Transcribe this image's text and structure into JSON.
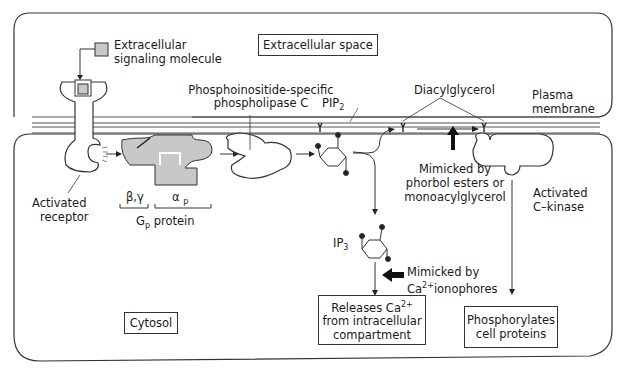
{
  "diagram": {
    "regions": {
      "extracellular": "Extracellular space",
      "cytosol": "Cytosol",
      "membrane_line1": "Plasma",
      "membrane_line2": "membrane"
    },
    "labels": {
      "signal_line1": "Extracellular",
      "signal_line2": "signaling molecule",
      "plc_line1": "Phosphoinositide-specific",
      "plc_line2": "phospholipase C",
      "pip2": "PIP",
      "pip2_sub": "2",
      "dag": "Diacylglycerol",
      "receptor_line1": "Activated",
      "receptor_line2": "receptor",
      "beta_gamma": "β,γ",
      "alpha": "α",
      "alpha_sub": "p",
      "gp_main": "G",
      "gp_sub": "p",
      "gp_rest": " protein",
      "phorbol_line1": "Mimicked by",
      "phorbol_line2": "phorbol esters or",
      "phorbol_line3": "monoacylglycerol",
      "ckinase_line1": "Activated",
      "ckinase_line2": "C–kinase",
      "ip3": "IP",
      "ip3_sub": "3",
      "iono_line1": "Mimicked by",
      "iono_ca": "Ca",
      "iono_sup": "2+",
      "iono_rest": "ionophores"
    },
    "outcomes": {
      "calcium_line1": "Releases Ca",
      "calcium_sup": "2+",
      "calcium_line2": "from intracellular",
      "calcium_line3": "compartment",
      "phos_line1": "Phosphorylates",
      "phos_line2": "cell proteins"
    },
    "colors": {
      "stroke": "#222222",
      "protein_fill": "#c8c8c8",
      "membrane": "#555555"
    }
  }
}
